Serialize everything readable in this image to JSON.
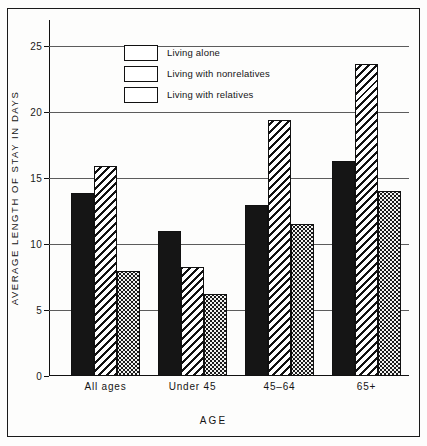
{
  "chart_data": {
    "type": "bar",
    "title": "",
    "xlabel": "AGE",
    "ylabel": "AVERAGE LENGTH OF STAY IN DAYS",
    "categories": [
      "All ages",
      "Under 45",
      "45–64",
      "65+"
    ],
    "series": [
      {
        "name": "Living alone",
        "pattern": "solid",
        "values": [
          13.9,
          11.0,
          13.0,
          16.3
        ]
      },
      {
        "name": "Living with nonrelatives",
        "pattern": "hatch",
        "values": [
          15.9,
          8.3,
          19.4,
          23.7
        ]
      },
      {
        "name": "Living with relatives",
        "pattern": "dots",
        "values": [
          8.0,
          6.2,
          11.5,
          14.0
        ]
      }
    ],
    "ylim": [
      0,
      27
    ],
    "yticks": [
      0,
      5,
      10,
      15,
      20,
      25
    ],
    "ytick_labels": [
      "0",
      "5",
      "10",
      "15",
      "20",
      "25"
    ],
    "grid": true,
    "legend_position": "top-left"
  },
  "colors": {
    "ink": "#151515",
    "grid": "#5c5c5c",
    "paper": "#fdfdfc",
    "dots_fill": "#f2f2f0"
  }
}
